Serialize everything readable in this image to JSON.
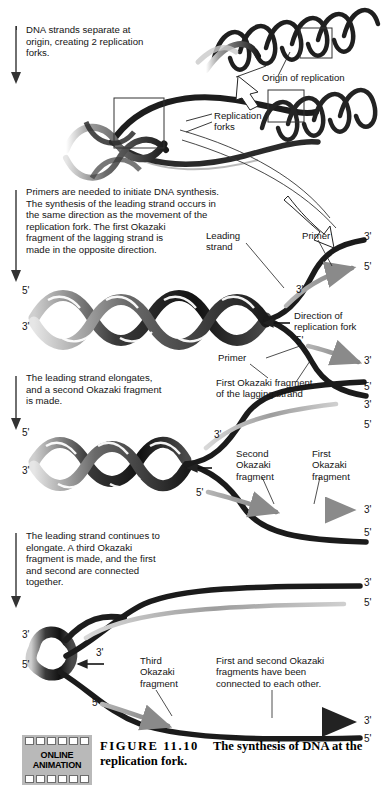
{
  "figure": {
    "number": "FIGURE 11.10",
    "title": "The synthesis of DNA at the",
    "title_line2": "replication fork.",
    "animation_badge_line1": "ONLINE",
    "animation_badge_line2": "ANIMATION"
  },
  "steps": [
    {
      "id": "step-1",
      "text": "DNA strands separate at\norigin, creating 2 replication\nforks."
    },
    {
      "id": "step-2",
      "text": "Primers are needed to initiate DNA synthesis.\nThe synthesis of the leading strand occurs in\nthe same direction as the movement of the\nreplication fork. The first Okazaki\nfragment of the lagging strand is\nmade in the opposite direction."
    },
    {
      "id": "step-3",
      "text": "The leading strand elongates,\nand a second Okazaki fragment\nis made."
    },
    {
      "id": "step-4",
      "text": "The leading strand continues to\nelongate. A third Okazaki\nfragment is made, and the first\nand second are connected\ntogether."
    }
  ],
  "labels": {
    "origin_of_replication": "Origin of replication",
    "replication_forks": "Replication\nforks",
    "leading_strand": "Leading\nstrand",
    "primer": "Primer",
    "direction_of_fork": "Direction of\nreplication fork",
    "first_okazaki_lagging": "First Okazaki fragment\nof the lagging strand",
    "second_okazaki": "Second\nOkazaki\nfragment",
    "first_okazaki": "First\nOkazaki\nfragment",
    "third_okazaki": "Third\nOkazaki\nfragment",
    "connected_note": "First and second Okazaki\nfragments have been\nconnected to each other."
  },
  "end_labels": {
    "five_prime": "5'",
    "three_prime": "3'"
  },
  "colors": {
    "template_strand": "#1c1c1c",
    "new_strand": "#8a8a8a",
    "text": "#141414",
    "badge_background": "#b9b9b9",
    "page_background": "#ffffff"
  },
  "panel2_ticks": {
    "left_top": "5'",
    "left_bottom": "3'",
    "fork_top3": "3'",
    "fork_upper_right_3": "3'",
    "fork_upper_right_5": "5'",
    "fork_lower_5": "5'",
    "fork_lower_right_3": "3'",
    "fork_bottom_5": "5'"
  },
  "panel3_ticks": {
    "left_top": "5'",
    "left_bottom": "3'",
    "fork_mid3": "3'",
    "top_right_3": "3'",
    "top_right_5": "5'",
    "lower_5": "5'",
    "frag_right_3": "3'",
    "bottom_5": "5'"
  },
  "panel4_ticks": {
    "left_top": "3'",
    "left_bottom": "5'",
    "fork_mid3": "3'",
    "top_right_3": "3'",
    "top_right_5": "5'",
    "lower_5": "5'",
    "frag_right_3": "3'",
    "bottom_5": "5'"
  }
}
